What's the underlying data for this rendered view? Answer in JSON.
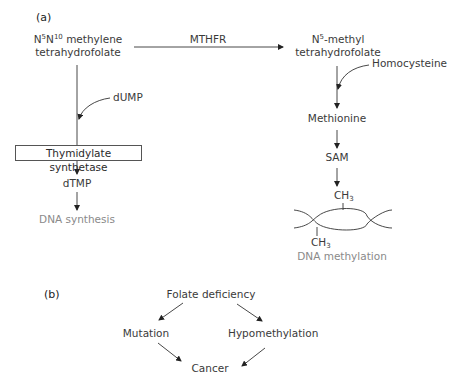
{
  "panel_a": {
    "label": "(a)",
    "nodes": {
      "methylene_thf": {
        "line1_pre": "N",
        "line1_sup1": "5",
        "line1_mid": "N",
        "line1_sup2": "10",
        "line1_post": " methylene",
        "line2": "tetrahydrofolate"
      },
      "methyl_thf": {
        "line1_pre": "N",
        "line1_sup": "5",
        "line1_post": "-methyl",
        "line2": "tetrahydrofolate"
      },
      "mthfr": "MTHFR",
      "dump": "dUMP",
      "thymidylate_synthetase": "Thymidylate synthetase",
      "dtmp": "dTMP",
      "dna_synthesis": "DNA synthesis",
      "homocysteine": "Homocysteine",
      "methionine": "Methionine",
      "sam": "SAM",
      "ch3_top": {
        "base": "CH",
        "sub": "3"
      },
      "ch3_bottom": {
        "base": "CH",
        "sub": "3"
      },
      "dna_methylation": "DNA methylation"
    }
  },
  "panel_b": {
    "label": "(b)",
    "nodes": {
      "folate_deficiency": "Folate deficiency",
      "mutation": "Mutation",
      "hypomethylation": "Hypomethylation",
      "cancer": "Cancer"
    }
  },
  "colors": {
    "text": "#3a3a3a",
    "muted_text": "#8a8a8a",
    "line": "#333333"
  }
}
